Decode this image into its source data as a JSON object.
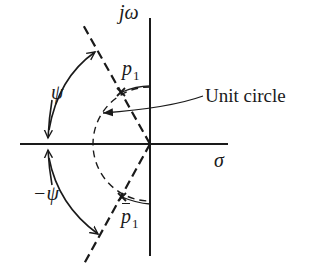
{
  "diagram": {
    "labels": {
      "imag_axis": "jω",
      "real_axis": "σ",
      "pole_upper": "p",
      "pole_upper_sub": "1",
      "pole_lower": "p",
      "pole_lower_sub": "1",
      "angle_pos": "ψ",
      "angle_neg": "−ψ",
      "unit_circle": "Unit circle"
    },
    "colors": {
      "ink": "#1a1a1a",
      "background": "#ffffff"
    }
  }
}
